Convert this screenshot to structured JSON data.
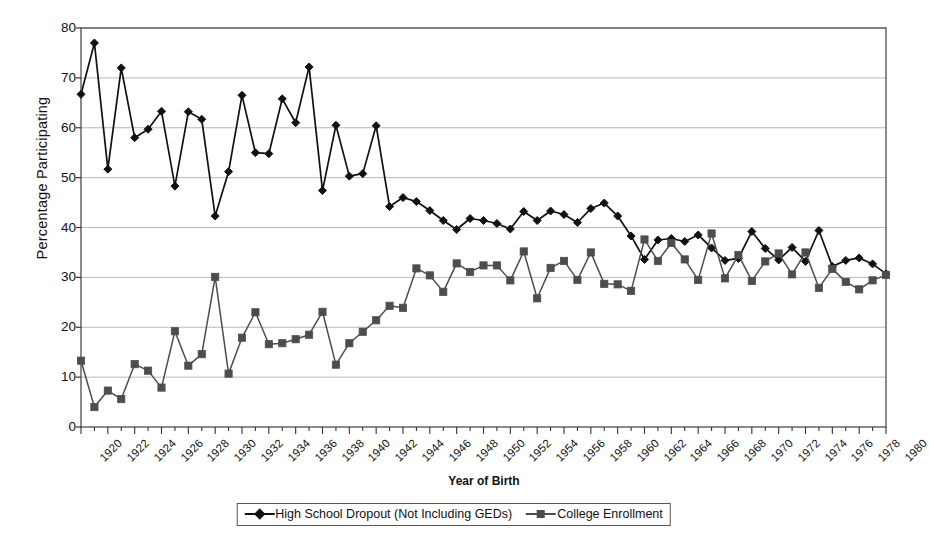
{
  "chart_data": {
    "type": "line",
    "title": "",
    "xlabel": "Year of Birth",
    "ylabel": "Percentage Participating",
    "xlim": [
      1920,
      1980
    ],
    "ylim": [
      0,
      80
    ],
    "yticks": [
      0,
      10,
      20,
      30,
      40,
      50,
      60,
      70,
      80
    ],
    "xticks": [
      1920,
      1922,
      1924,
      1926,
      1928,
      1930,
      1932,
      1934,
      1936,
      1938,
      1940,
      1942,
      1944,
      1946,
      1948,
      1950,
      1952,
      1954,
      1956,
      1958,
      1960,
      1962,
      1964,
      1966,
      1968,
      1970,
      1972,
      1974,
      1976,
      1978,
      1980
    ],
    "grid": "horizontal",
    "legend_position": "bottom",
    "x": [
      1920,
      1921,
      1922,
      1923,
      1924,
      1925,
      1926,
      1927,
      1928,
      1929,
      1930,
      1931,
      1932,
      1933,
      1934,
      1935,
      1936,
      1937,
      1938,
      1939,
      1940,
      1941,
      1942,
      1943,
      1944,
      1945,
      1946,
      1947,
      1948,
      1949,
      1950,
      1951,
      1952,
      1953,
      1954,
      1955,
      1956,
      1957,
      1958,
      1959,
      1960,
      1961,
      1962,
      1963,
      1964,
      1965,
      1966,
      1967,
      1968,
      1969,
      1970,
      1971,
      1972,
      1973,
      1974,
      1975,
      1976,
      1977,
      1978,
      1979,
      1980
    ],
    "series": [
      {
        "name": "High School Dropout (Not Including GEDs)",
        "color": "#111111",
        "marker": "diamond",
        "values": [
          66.7,
          77.0,
          51.7,
          72.0,
          58.0,
          59.7,
          63.3,
          48.3,
          63.2,
          61.7,
          42.3,
          51.2,
          66.5,
          55.0,
          54.8,
          65.8,
          61.0,
          72.2,
          47.4,
          60.5,
          50.3,
          50.8,
          60.4,
          44.2,
          46.0,
          45.2,
          43.4,
          41.4,
          39.6,
          41.8,
          41.4,
          40.8,
          39.7,
          43.2,
          41.4,
          43.3,
          42.6,
          41.0,
          43.8,
          44.9,
          42.3,
          38.3,
          33.6,
          37.5,
          37.8,
          37.2,
          38.5,
          35.9,
          33.4,
          33.8,
          39.2,
          35.8,
          33.5,
          36.0,
          33.2,
          39.4,
          32.2,
          33.4,
          33.9,
          32.7,
          30.7
        ]
      },
      {
        "name": "College Enrollment",
        "color": "#4d4d4d",
        "marker": "square",
        "values": [
          13.3,
          4.0,
          7.3,
          5.6,
          12.6,
          11.3,
          7.9,
          19.2,
          12.3,
          14.6,
          30.1,
          10.7,
          17.9,
          23.0,
          16.6,
          16.8,
          17.6,
          18.5,
          23.1,
          12.5,
          16.8,
          19.1,
          21.4,
          24.3,
          23.9,
          31.8,
          30.4,
          27.1,
          32.8,
          31.1,
          32.4,
          32.4,
          29.4,
          35.2,
          25.8,
          31.9,
          33.3,
          29.5,
          35.0,
          28.7,
          28.6,
          27.3,
          37.6,
          33.3,
          36.9,
          33.6,
          29.5,
          38.8,
          29.8,
          34.5,
          29.3,
          33.2,
          34.8,
          30.6,
          35.0,
          27.9,
          31.7,
          29.1,
          27.6,
          29.4,
          30.5
        ]
      }
    ]
  },
  "axes": {
    "x_title": "Year of Birth",
    "y_title": "Percentage Participating"
  },
  "legend": {
    "entries": [
      {
        "label": "High School Dropout (Not Including GEDs)",
        "marker": "diamond",
        "color": "#111111"
      },
      {
        "label": "College Enrollment",
        "marker": "square",
        "color": "#4d4d4d"
      }
    ]
  }
}
